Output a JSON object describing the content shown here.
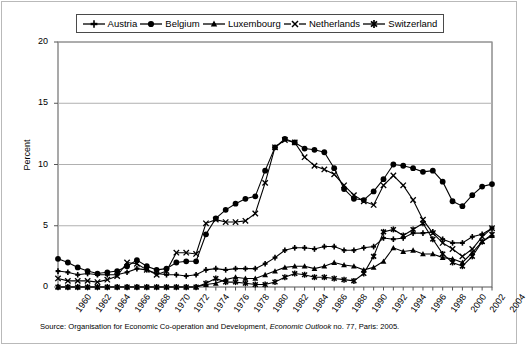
{
  "chart_data": {
    "type": "line",
    "title": "",
    "xlabel": "",
    "ylabel": "Percent",
    "ylim": [
      0,
      20
    ],
    "yticks": [
      0,
      5,
      10,
      15,
      20
    ],
    "grid": true,
    "legend_position": "top",
    "x": [
      1960,
      1961,
      1962,
      1963,
      1964,
      1965,
      1966,
      1967,
      1968,
      1969,
      1970,
      1971,
      1972,
      1973,
      1974,
      1975,
      1976,
      1977,
      1978,
      1979,
      1980,
      1981,
      1982,
      1983,
      1984,
      1985,
      1986,
      1987,
      1988,
      1989,
      1990,
      1991,
      1992,
      1993,
      1994,
      1995,
      1996,
      1997,
      1998,
      1999,
      2000,
      2001,
      2002,
      2003,
      2004
    ],
    "xticklabels": [
      "1960",
      "1962",
      "1964",
      "1966",
      "1968",
      "1970",
      "1972",
      "1974",
      "1976",
      "1978",
      "1980",
      "1982",
      "1984",
      "1986",
      "1988",
      "1990",
      "1992",
      "1994",
      "1996",
      "1998",
      "2000",
      "2002",
      "2004"
    ],
    "series": [
      {
        "name": "Austria",
        "marker": "plus",
        "values": [
          1.3,
          1.2,
          1.0,
          1.1,
          1.0,
          1.0,
          1.0,
          1.2,
          1.5,
          1.4,
          1.1,
          1.0,
          1.0,
          0.9,
          1.0,
          1.4,
          1.5,
          1.4,
          1.5,
          1.5,
          1.5,
          1.9,
          2.4,
          3.0,
          3.2,
          3.2,
          3.1,
          3.3,
          3.3,
          3.0,
          3.0,
          3.2,
          3.3,
          4.0,
          3.9,
          4.0,
          4.4,
          4.4,
          4.5,
          3.9,
          3.6,
          3.6,
          4.1,
          4.3,
          4.8
        ]
      },
      {
        "name": "Belgium",
        "marker": "circle",
        "values": [
          2.3,
          2.0,
          1.6,
          1.3,
          1.1,
          1.2,
          1.3,
          1.7,
          2.2,
          1.7,
          1.4,
          1.5,
          2.0,
          2.1,
          2.1,
          4.3,
          5.6,
          6.3,
          6.8,
          7.2,
          7.4,
          9.5,
          11.4,
          12.1,
          11.8,
          11.3,
          11.2,
          11.0,
          9.7,
          8.0,
          7.2,
          7.1,
          7.8,
          8.8,
          10.0,
          9.9,
          9.7,
          9.4,
          9.5,
          8.6,
          7.0,
          6.6,
          7.5,
          8.2,
          8.4
        ]
      },
      {
        "name": "Luxembourg",
        "marker": "triangle",
        "values": [
          0.0,
          0.0,
          0.0,
          0.0,
          0.0,
          0.0,
          0.0,
          0.0,
          0.0,
          0.0,
          0.0,
          0.0,
          0.0,
          0.0,
          0.0,
          0.2,
          0.3,
          0.6,
          0.8,
          0.7,
          0.7,
          1.0,
          1.3,
          1.6,
          1.7,
          1.7,
          1.5,
          1.7,
          2.0,
          1.8,
          1.7,
          1.4,
          1.6,
          2.1,
          3.2,
          2.9,
          3.0,
          2.7,
          2.7,
          2.4,
          2.3,
          2.0,
          2.8,
          3.7,
          4.2
        ]
      },
      {
        "name": "Netherlands",
        "marker": "x",
        "values": [
          0.7,
          0.5,
          0.5,
          0.5,
          0.4,
          0.6,
          0.9,
          2.0,
          1.9,
          1.4,
          1.0,
          1.3,
          2.8,
          2.8,
          2.7,
          5.2,
          5.5,
          5.3,
          5.3,
          5.4,
          6.0,
          8.5,
          11.4,
          12.0,
          11.8,
          10.6,
          9.9,
          9.6,
          9.2,
          8.3,
          7.5,
          7.0,
          6.7,
          8.3,
          9.1,
          8.3,
          7.1,
          5.5,
          4.4,
          3.6,
          3.1,
          2.5,
          3.1,
          4.1,
          4.8
        ]
      },
      {
        "name": "Switzerland",
        "marker": "asterisk",
        "values": [
          0.0,
          0.0,
          0.0,
          0.0,
          0.0,
          0.0,
          0.0,
          0.0,
          0.0,
          0.0,
          0.0,
          0.0,
          0.0,
          0.0,
          0.0,
          0.3,
          0.7,
          0.4,
          0.4,
          0.3,
          0.2,
          0.2,
          0.4,
          0.8,
          1.1,
          1.0,
          0.8,
          0.8,
          0.7,
          0.6,
          0.5,
          1.1,
          2.5,
          4.5,
          4.7,
          4.2,
          4.7,
          5.2,
          3.9,
          2.7,
          2.0,
          1.7,
          2.5,
          3.7,
          4.3
        ]
      }
    ]
  },
  "legend": {
    "items": [
      {
        "label": "Austria",
        "marker": "plus"
      },
      {
        "label": "Belgium",
        "marker": "circle"
      },
      {
        "label": "Luxembourg",
        "marker": "triangle"
      },
      {
        "label": "Netherlands",
        "marker": "x"
      },
      {
        "label": "Switzerland",
        "marker": "asterisk"
      }
    ]
  },
  "axis": {
    "ylabel": "Percent",
    "yticks": [
      "0",
      "5",
      "10",
      "15",
      "20"
    ]
  },
  "source": {
    "prefix": "Source: Organisation for Economic Co-operation and Development, ",
    "italic": "Economic Outlook",
    "suffix": " no. 77, Paris: 2005."
  },
  "colors": {
    "line": "#000000",
    "grid": "#b0b0b0",
    "axis": "#555555",
    "frame": "#b9b9b9"
  }
}
